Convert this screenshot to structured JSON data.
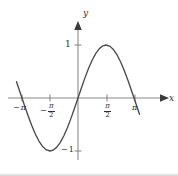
{
  "chart_data": {
    "type": "line",
    "title": "",
    "subtitle": "",
    "xlabel": "x",
    "ylabel": "y",
    "function": "y = sin(x)",
    "grid": false,
    "legend": false,
    "xlim": [
      -3.6,
      3.6
    ],
    "ylim": [
      -1.45,
      1.45
    ],
    "x_ticks": [
      {
        "value": -3.14159,
        "label": "-π",
        "kind": "negative-pi"
      },
      {
        "value": -1.5708,
        "label": "-π/2",
        "kind": "negative-pi-over-2"
      },
      {
        "value": 1.5708,
        "label": "π/2",
        "kind": "pi-over-2"
      },
      {
        "value": 3.14159,
        "label": "π",
        "kind": "pi"
      }
    ],
    "y_ticks": [
      {
        "value": 1,
        "label": "1"
      },
      {
        "value": -1,
        "label": "-1"
      }
    ],
    "x": [
      -3.45,
      -3.2,
      -3.0,
      -2.8,
      -2.6,
      -2.4,
      -2.2,
      -2.0,
      -1.8,
      -1.5708,
      -1.4,
      -1.2,
      -1.0,
      -0.8,
      -0.6,
      -0.4,
      -0.2,
      0.0,
      0.2,
      0.4,
      0.6,
      0.8,
      1.0,
      1.2,
      1.4,
      1.5708,
      1.8,
      2.0,
      2.2,
      2.4,
      2.6,
      2.8,
      3.0,
      3.2,
      3.45
    ],
    "y": [
      0.307,
      0.058,
      -0.141,
      -0.335,
      -0.516,
      -0.675,
      -0.808,
      -0.909,
      -0.974,
      -1.0,
      -0.985,
      -0.932,
      -0.841,
      -0.717,
      -0.565,
      -0.389,
      -0.199,
      0.0,
      0.199,
      0.389,
      0.565,
      0.717,
      0.841,
      0.932,
      0.985,
      1.0,
      0.974,
      0.909,
      0.808,
      0.675,
      0.516,
      0.335,
      0.141,
      -0.058,
      -0.307
    ],
    "key_points": {
      "minimum": {
        "x": -1.5708,
        "y": -1,
        "label": "trough at -π/2"
      },
      "maximum": {
        "x": 1.5708,
        "y": 1,
        "label": "peak at π/2"
      },
      "zeros": [
        -3.14159,
        0,
        3.14159
      ]
    },
    "colors": {
      "curve": "#4a4a4a",
      "axis": "#8a8a8a",
      "text": "#2e2e2e",
      "background": "#ffffff"
    }
  },
  "labels": {
    "x_axis_name": "x",
    "y_axis_name": "y",
    "y_tick_one": "1",
    "y_tick_minus_one_sign": "−",
    "y_tick_minus_one_value": "1",
    "minus_sign": "−",
    "pi_symbol": "π",
    "two": "2"
  }
}
